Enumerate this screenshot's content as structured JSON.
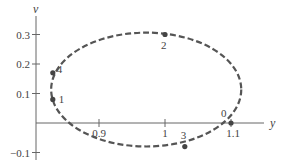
{
  "chart_data": {
    "type": "line",
    "title": "",
    "xlabel": "y",
    "ylabel": "v",
    "xlim": [
      0.78,
      1.17
    ],
    "ylim": [
      -0.11,
      0.34
    ],
    "grid": false,
    "legend": null,
    "x_ticks": [
      {
        "value": 0.9,
        "label": "0.9"
      },
      {
        "value": 1.0,
        "label": "1"
      },
      {
        "value": 1.1,
        "label": "1.1"
      }
    ],
    "y_ticks": [
      {
        "value": 0.3,
        "label": "0.3"
      },
      {
        "value": 0.2,
        "label": "0.2"
      },
      {
        "value": 0.1,
        "label": "0.1"
      },
      {
        "value": -0.1,
        "label": "-0.1"
      }
    ],
    "series": [
      {
        "name": "phase trajectory (dashed closed curve)",
        "style": "dashed",
        "shape": "ellipse",
        "center": [
          0.97,
          0.11
        ],
        "semi_axis_y": 0.144,
        "semi_axis_v": 0.193
      }
    ],
    "points": [
      {
        "label": "0",
        "y": 1.1,
        "v": 0.0
      },
      {
        "label": "1",
        "y": 0.83,
        "v": 0.08
      },
      {
        "label": "2",
        "y": 1.0,
        "v": 0.3
      },
      {
        "label": "3",
        "y": 1.03,
        "v": -0.08
      },
      {
        "label": "4",
        "y": 0.83,
        "v": 0.17
      }
    ]
  }
}
